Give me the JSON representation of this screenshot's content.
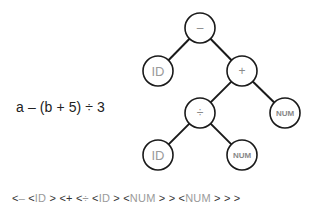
{
  "expression": "a – (b + 5) ÷ 3",
  "tree": {
    "nodes": [
      {
        "id": "root",
        "label": "–",
        "kind": "op",
        "cx": 200,
        "cy": 28
      },
      {
        "id": "id1",
        "label": "ID",
        "kind": "id",
        "cx": 158,
        "cy": 71
      },
      {
        "id": "plus",
        "label": "+",
        "kind": "op",
        "cx": 242,
        "cy": 71
      },
      {
        "id": "div",
        "label": "÷",
        "kind": "op",
        "cx": 200,
        "cy": 113
      },
      {
        "id": "num1",
        "label": "NUM",
        "kind": "num",
        "cx": 285,
        "cy": 113
      },
      {
        "id": "id2",
        "label": "ID",
        "kind": "id",
        "cx": 158,
        "cy": 155
      },
      {
        "id": "num2",
        "label": "NUM",
        "kind": "num",
        "cx": 242,
        "cy": 155
      }
    ],
    "edges": [
      [
        "root",
        "id1"
      ],
      [
        "root",
        "plus"
      ],
      [
        "plus",
        "div"
      ],
      [
        "plus",
        "num1"
      ],
      [
        "div",
        "id2"
      ],
      [
        "div",
        "num2"
      ]
    ],
    "node_radius": 15
  },
  "serialization": {
    "tokens": [
      {
        "t": "<",
        "c": "br"
      },
      {
        "t": "–",
        "c": "tok"
      },
      {
        "t": " ",
        "c": "br"
      },
      {
        "t": "<",
        "c": "br"
      },
      {
        "t": "ID",
        "c": "tok"
      },
      {
        "t": " > ",
        "c": "br"
      },
      {
        "t": "<",
        "c": "br"
      },
      {
        "t": "+",
        "c": "br"
      },
      {
        "t": " ",
        "c": "br"
      },
      {
        "t": "<",
        "c": "br"
      },
      {
        "t": "÷",
        "c": "tok"
      },
      {
        "t": " ",
        "c": "br"
      },
      {
        "t": "<",
        "c": "br"
      },
      {
        "t": "ID",
        "c": "tok"
      },
      {
        "t": " > ",
        "c": "br"
      },
      {
        "t": "<",
        "c": "br"
      },
      {
        "t": "NUM",
        "c": "tok"
      },
      {
        "t": " > > ",
        "c": "br"
      },
      {
        "t": "<",
        "c": "br"
      },
      {
        "t": "NUM",
        "c": "tok"
      },
      {
        "t": " > > >",
        "c": "br"
      }
    ],
    "text": "<– <ID > <+ <÷ <ID > <NUM > > <NUM > > >"
  }
}
